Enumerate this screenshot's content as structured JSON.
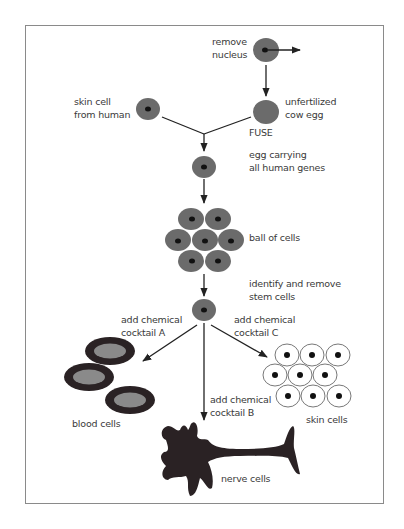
{
  "diagram": {
    "colors": {
      "frame": "#8a8a8a",
      "cell_fill": "#6b6b6b",
      "nucleus": "#111111",
      "line": "#222222",
      "text": "#3a3a3a",
      "blood_outer": "#2a2224",
      "blood_inner": "#8a8a8a",
      "nerve": "#2a2224",
      "skin_cell_stroke": "#555555"
    },
    "labels": {
      "remove_nucleus": "remove\nnucleus",
      "skin_cell_from_human": "skin cell\nfrom human",
      "unfertilized_cow_egg": "unfertilized\ncow egg",
      "fuse": "FUSE",
      "egg_carrying": "egg carrying\nall human genes",
      "ball_of_cells": "ball of cells",
      "identify_remove": "identify and remove\nstem cells",
      "cocktail_a": "add chemical\ncocktail A",
      "cocktail_c": "add chemical\ncocktail C",
      "cocktail_b": "add chemical\ncocktail B",
      "blood_cells": "blood cells",
      "skin_cells": "skin cells",
      "nerve_cells": "nerve cells"
    },
    "steps": [
      {
        "id": "remove-nucleus",
        "label": "remove nucleus"
      },
      {
        "id": "unfertilized-cow-egg",
        "label": "unfertilized cow egg"
      },
      {
        "id": "skin-cell-from-human",
        "label": "skin cell from human"
      },
      {
        "id": "fuse",
        "label": "FUSE"
      },
      {
        "id": "egg-carrying-human-genes",
        "label": "egg carrying all human genes"
      },
      {
        "id": "ball-of-cells",
        "label": "ball of cells"
      },
      {
        "id": "stem-cells",
        "label": "identify and remove stem cells"
      },
      {
        "id": "blood-cells",
        "label": "blood cells",
        "via": "add chemical cocktail A"
      },
      {
        "id": "nerve-cells",
        "label": "nerve cells",
        "via": "add chemical cocktail B"
      },
      {
        "id": "skin-cells",
        "label": "skin cells",
        "via": "add chemical cocktail C"
      }
    ]
  }
}
